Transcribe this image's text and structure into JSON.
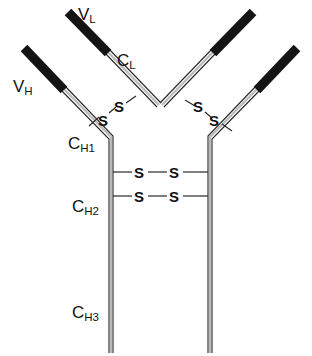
{
  "figure": {
    "width": 312,
    "height": 356,
    "background_color": "#ffffff"
  },
  "colors": {
    "variable_domain": "#141414",
    "constant_domain_outline": "#2a2a2a",
    "constant_domain_fill": "#b9b9b9",
    "label_text": "#111111"
  },
  "labels": {
    "v_l": "V",
    "v_l_sub": "L",
    "v_h": "V",
    "v_h_sub": "H",
    "c_l": "C",
    "c_l_sub": "L",
    "c_h1": "C",
    "c_h1_sub": "H1",
    "c_h2": "C",
    "c_h2_sub": "H2",
    "c_h3": "C",
    "c_h3_sub": "H3"
  },
  "disulfides": {
    "sulfur_symbol": "S",
    "left_interchain": {
      "s_upper": "S",
      "s_lower": "S"
    },
    "right_interchain": {
      "s_upper": "S",
      "s_lower": "S"
    },
    "hinge_bond_1": {
      "s_left": "S",
      "s_right": "S"
    },
    "hinge_bond_2": {
      "s_left": "S",
      "s_right": "S"
    }
  },
  "chains": {
    "heavy_left": {
      "variable_segment": "M 22,50 L 64,93",
      "constant_segment": "M 64,93 L 112,142 L 112,352"
    },
    "heavy_right": {
      "variable_segment": "M 299,50 L 257,93",
      "constant_segment": "M 257,93 L 209,142 L 209,352"
    },
    "light_left": {
      "variable_segment": "M 66,14 L 108,57",
      "constant_segment": "M 108,57 L 155,105"
    },
    "light_right": {
      "variable_segment": "M 255,14 L 213,57",
      "constant_segment": "M 213,57 L 166,105"
    }
  }
}
